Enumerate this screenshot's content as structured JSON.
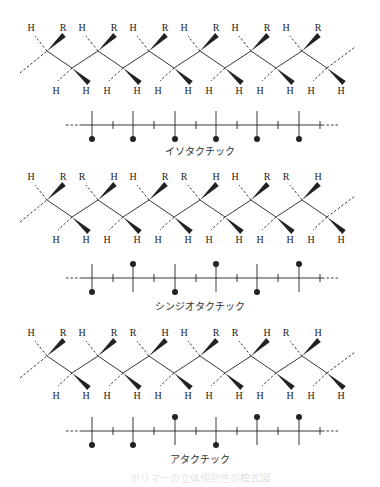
{
  "figure": {
    "caption": "ポリマーの立体規則性の模式図",
    "panels": [
      {
        "name": "isotactic",
        "label": "イソタクチック",
        "top_pairs": [
          [
            "H",
            "R"
          ],
          [
            "H",
            "R"
          ],
          [
            "H",
            "R"
          ],
          [
            "H",
            "R"
          ],
          [
            "H",
            "R"
          ],
          [
            "H",
            "R"
          ]
        ],
        "bottom_pairs": [
          [
            "H",
            "H"
          ],
          [
            "H",
            "H"
          ],
          [
            "H",
            "H"
          ],
          [
            "H",
            "H"
          ],
          [
            "H",
            "H"
          ],
          [
            "H",
            "H"
          ]
        ],
        "fischer": [
          "down",
          "down",
          "down",
          "down",
          "down",
          "down"
        ]
      },
      {
        "name": "syndiotactic",
        "label": "シンジオタクチック",
        "top_pairs": [
          [
            "H",
            "R"
          ],
          [
            "R",
            "H"
          ],
          [
            "H",
            "R"
          ],
          [
            "R",
            "H"
          ],
          [
            "H",
            "R"
          ],
          [
            "R",
            "H"
          ]
        ],
        "bottom_pairs": [
          [
            "H",
            "H"
          ],
          [
            "H",
            "H"
          ],
          [
            "H",
            "H"
          ],
          [
            "H",
            "H"
          ],
          [
            "H",
            "H"
          ],
          [
            "H",
            "H"
          ]
        ],
        "fischer": [
          "down",
          "up",
          "down",
          "up",
          "down",
          "up"
        ]
      },
      {
        "name": "atactic",
        "label": "アタクチック",
        "top_pairs": [
          [
            "H",
            "R"
          ],
          [
            "H",
            "R"
          ],
          [
            "R",
            "H"
          ],
          [
            "H",
            "R"
          ],
          [
            "R",
            "H"
          ],
          [
            "R",
            "H"
          ]
        ],
        "bottom_pairs": [
          [
            "H",
            "H"
          ],
          [
            "H",
            "H"
          ],
          [
            "H",
            "H"
          ],
          [
            "H",
            "H"
          ],
          [
            "H",
            "H"
          ],
          [
            "H",
            "H"
          ]
        ],
        "fischer": [
          "down",
          "down",
          "up",
          "down",
          "up",
          "up"
        ]
      }
    ]
  },
  "colors": {
    "ink": "#222222",
    "background": "#ffffff"
  }
}
